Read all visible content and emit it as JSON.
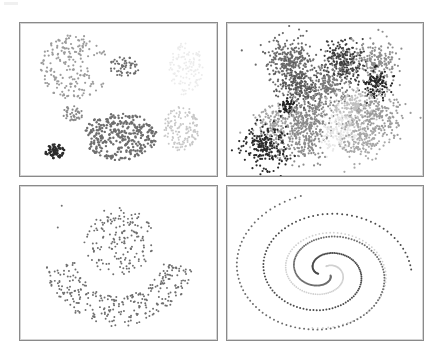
{
  "figure": {
    "layout": "2x2 grid",
    "background": "#ffffff",
    "panel_border": "#8a8a8a"
  },
  "chart_data": [
    {
      "type": "scatter",
      "title": "",
      "xlabel": "",
      "ylabel": "",
      "axes": "none",
      "grid": false,
      "legend": "none",
      "description": "Blobs of varying density/size (7 clusters)",
      "xlim": [
        0,
        199
      ],
      "ylim": [
        0,
        155
      ],
      "clusters": [
        {
          "shape": "crescent-blob",
          "cx": 55,
          "cy": 45,
          "rx": 35,
          "ry": 33,
          "n": 220,
          "color": "#9c9c9c",
          "r": 1.1
        },
        {
          "shape": "ellipse",
          "cx": 106,
          "cy": 44,
          "rx": 17,
          "ry": 10,
          "n": 55,
          "color": "#6c6c6c",
          "r": 1.1
        },
        {
          "shape": "ellipse",
          "cx": 168,
          "cy": 47,
          "rx": 17,
          "ry": 28,
          "n": 130,
          "color": "#ececec",
          "r": 1.0
        },
        {
          "shape": "ellipse",
          "cx": 53,
          "cy": 92,
          "rx": 11,
          "ry": 8,
          "n": 40,
          "color": "#8a8a8a",
          "r": 1.1
        },
        {
          "shape": "ellipse",
          "cx": 101,
          "cy": 115,
          "rx": 38,
          "ry": 24,
          "n": 330,
          "color": "#6e6e6e",
          "r": 1.2
        },
        {
          "shape": "ellipse",
          "cx": 35,
          "cy": 130,
          "rx": 10,
          "ry": 7,
          "n": 60,
          "color": "#2d2d2d",
          "r": 1.3
        },
        {
          "shape": "ellipse",
          "cx": 163,
          "cy": 107,
          "rx": 18,
          "ry": 23,
          "n": 150,
          "color": "#c8c8c8",
          "r": 1.0
        }
      ]
    },
    {
      "type": "scatter",
      "title": "",
      "xlabel": "",
      "ylabel": "",
      "axes": "none",
      "grid": false,
      "legend": "none",
      "description": "Many overlapping Gaussian blobs (~15 clusters)",
      "xlim": [
        0,
        198
      ],
      "ylim": [
        0,
        155
      ],
      "clusters": [
        {
          "cx": 63,
          "cy": 38,
          "s": 12,
          "n": 260,
          "color": "#6a6a6a"
        },
        {
          "cx": 117,
          "cy": 38,
          "s": 10,
          "n": 220,
          "color": "#3e3e3e"
        },
        {
          "cx": 150,
          "cy": 40,
          "s": 11,
          "n": 200,
          "color": "#8e8e8e"
        },
        {
          "cx": 150,
          "cy": 62,
          "s": 7,
          "n": 120,
          "color": "#262626"
        },
        {
          "cx": 73,
          "cy": 65,
          "s": 11,
          "n": 220,
          "color": "#585858"
        },
        {
          "cx": 103,
          "cy": 62,
          "s": 10,
          "n": 180,
          "color": "#7a7a7a"
        },
        {
          "cx": 62,
          "cy": 85,
          "s": 5,
          "n": 50,
          "color": "#1e1e1e"
        },
        {
          "cx": 128,
          "cy": 88,
          "s": 11,
          "n": 200,
          "color": "#c0c0c0"
        },
        {
          "cx": 153,
          "cy": 92,
          "s": 12,
          "n": 200,
          "color": "#9a9a9a"
        },
        {
          "cx": 82,
          "cy": 92,
          "s": 12,
          "n": 200,
          "color": "#878787"
        },
        {
          "cx": 50,
          "cy": 108,
          "s": 12,
          "n": 200,
          "color": "#a2a2a2"
        },
        {
          "cx": 78,
          "cy": 117,
          "s": 11,
          "n": 180,
          "color": "#8c8c8c"
        },
        {
          "cx": 112,
          "cy": 112,
          "s": 10,
          "n": 150,
          "color": "#e8e8e8"
        },
        {
          "cx": 136,
          "cy": 118,
          "s": 11,
          "n": 160,
          "color": "#a8a8a8"
        },
        {
          "cx": 38,
          "cy": 125,
          "s": 11,
          "n": 220,
          "color": "#2a2a2a"
        }
      ]
    },
    {
      "type": "scatter",
      "title": "",
      "xlabel": "",
      "ylabel": "",
      "axes": "none",
      "grid": false,
      "legend": "none",
      "description": "Single-color points forming a circle over an arc (smiley / cup shape)",
      "xlim": [
        0,
        199
      ],
      "ylim": [
        0,
        156
      ],
      "color": "#6e6e6e",
      "shapes": [
        {
          "shape": "disk",
          "cx": 100,
          "cy": 56,
          "rx": 36,
          "ry": 34,
          "n": 170
        },
        {
          "shape": "arc",
          "cx": 100,
          "cy": 70,
          "r_inner": 44,
          "r_outer": 76,
          "ry_scale": 0.95,
          "angle_start": 10,
          "angle_end": 170,
          "n": 300
        },
        {
          "shape": "points",
          "pts": [
            [
              42,
              20
            ],
            [
              38,
              42
            ]
          ]
        }
      ]
    },
    {
      "type": "scatter",
      "title": "",
      "xlabel": "",
      "ylabel": "",
      "axes": "none",
      "grid": false,
      "legend": "none",
      "description": "Three interleaved spirals",
      "xlim": [
        0,
        198
      ],
      "ylim": [
        0,
        156
      ],
      "center": [
        99,
        87
      ],
      "spirals": [
        {
          "color": "#4a4a4a",
          "phase": 160,
          "n": 150,
          "r_start": 8,
          "r_end": 95,
          "turns": 1.55,
          "dot": 1.0
        },
        {
          "color": "#d0d0d0",
          "phase": 280,
          "n": 130,
          "r_start": 8,
          "r_end": 80,
          "turns": 1.5,
          "dot": 0.9
        },
        {
          "color": "#6c6c6c",
          "phase": 40,
          "n": 170,
          "r_start": 8,
          "r_end": 110,
          "turns": 1.6,
          "dot": 1.0
        }
      ]
    }
  ]
}
